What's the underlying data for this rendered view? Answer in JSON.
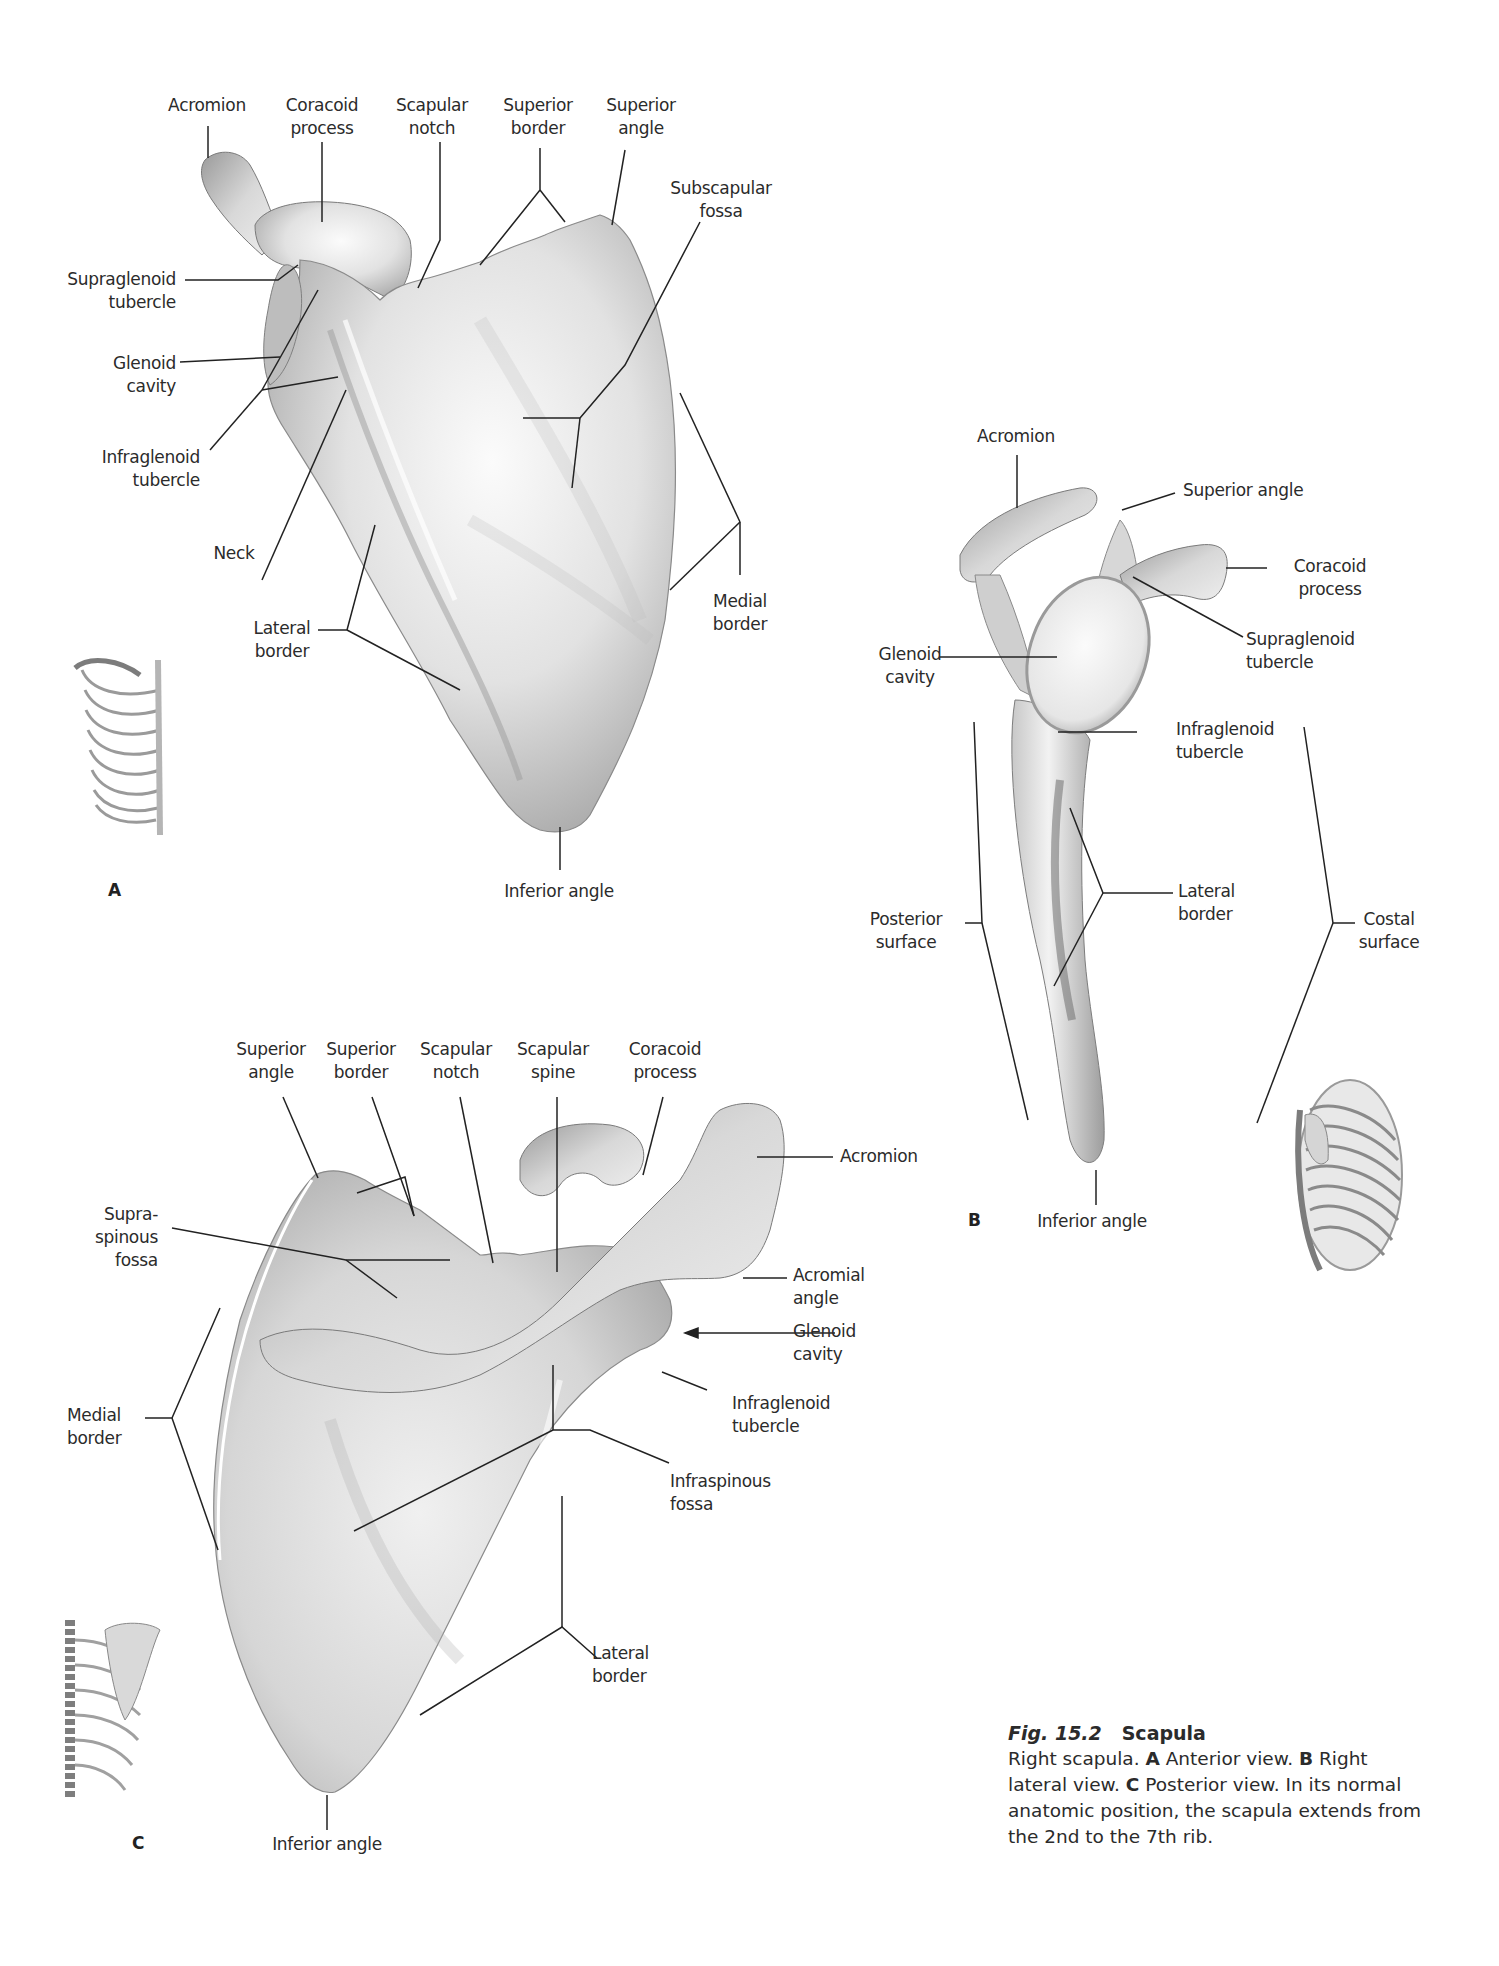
{
  "caption": {
    "fig_prefix": "Fig. 15.2",
    "title": "Scapula",
    "parts": [
      {
        "text": "Right scapula. ",
        "bold": false
      },
      {
        "text": "A",
        "bold": true
      },
      {
        "text": "  Anterior view. ",
        "bold": false
      },
      {
        "text": "B",
        "bold": true
      },
      {
        "text": "  Right lateral view. ",
        "bold": false
      },
      {
        "text": "C",
        "bold": true
      },
      {
        "text": "  Posterior view. In its normal anatomic position, the scapula extends from the 2nd to the 7th rib.",
        "bold": false
      }
    ]
  },
  "panels": {
    "A": {
      "letter": "A",
      "view": "Anterior view",
      "labels": {
        "acromion": [
          "Acromion"
        ],
        "coracoid_process": [
          "Coracoid",
          "process"
        ],
        "scapular_notch": [
          "Scapular",
          "notch"
        ],
        "superior_border": [
          "Superior",
          "border"
        ],
        "superior_angle": [
          "Superior",
          "angle"
        ],
        "subscapular_fossa": [
          "Subscapular",
          "fossa"
        ],
        "supraglenoid_tubercle": [
          "Supraglenoid",
          "tubercle"
        ],
        "glenoid_cavity": [
          "Glenoid",
          "cavity"
        ],
        "infraglenoid_tubercle": [
          "Infraglenoid",
          "tubercle"
        ],
        "neck": [
          "Neck"
        ],
        "lateral_border": [
          "Lateral",
          "border"
        ],
        "medial_border": [
          "Medial",
          "border"
        ],
        "inferior_angle": [
          "Inferior angle"
        ]
      }
    },
    "B": {
      "letter": "B",
      "view": "Right lateral view",
      "labels": {
        "acromion": [
          "Acromion"
        ],
        "superior_angle": [
          "Superior angle"
        ],
        "coracoid_process": [
          "Coracoid",
          "process"
        ],
        "supraglenoid_tubercle": [
          "Supraglenoid",
          "tubercle"
        ],
        "glenoid_cavity": [
          "Glenoid",
          "cavity"
        ],
        "infraglenoid_tubercle": [
          "Infraglenoid",
          "tubercle"
        ],
        "lateral_border": [
          "Lateral",
          "border"
        ],
        "posterior_surface": [
          "Posterior",
          "surface"
        ],
        "costal_surface": [
          "Costal",
          "surface"
        ],
        "inferior_angle": [
          "Inferior angle"
        ]
      }
    },
    "C": {
      "letter": "C",
      "view": "Posterior view",
      "labels": {
        "superior_angle": [
          "Superior",
          "angle"
        ],
        "superior_border": [
          "Superior",
          "border"
        ],
        "scapular_notch": [
          "Scapular",
          "notch"
        ],
        "scapular_spine": [
          "Scapular",
          "spine"
        ],
        "coracoid_process": [
          "Coracoid",
          "process"
        ],
        "acromion": [
          "Acromion"
        ],
        "supraspinous_fossa": [
          "Supra-",
          "spinous",
          "fossa"
        ],
        "acromial_angle": [
          "Acromial",
          "angle"
        ],
        "glenoid_cavity": [
          "Glenoid",
          "cavity"
        ],
        "medial_border": [
          "Medial",
          "border"
        ],
        "infraglenoid_tubercle": [
          "Infraglenoid",
          "tubercle"
        ],
        "infraspinous_fossa": [
          "Infraspinous",
          "fossa"
        ],
        "lateral_border": [
          "Lateral",
          "border"
        ],
        "inferior_angle": [
          "Inferior angle"
        ]
      }
    }
  },
  "colors": {
    "bone_light": "#f2f2f2",
    "bone_mid": "#c9c9c9",
    "bone_dark": "#8a8a8a",
    "leader": "#222222",
    "text": "#2b2b2b"
  }
}
